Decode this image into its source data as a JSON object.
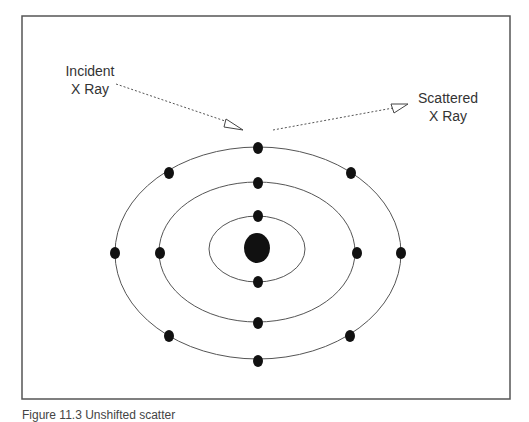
{
  "diagram": {
    "labels": {
      "incident": [
        "Incident",
        "X Ray"
      ],
      "scattered": [
        "Scattered",
        "X Ray"
      ]
    },
    "caption": "Figure 11.3 Unshifted scatter",
    "nucleus": {
      "cx": 257,
      "cy": 249,
      "rx": 13,
      "ry": 15
    },
    "orbits": [
      {
        "name": "inner",
        "rx": 48,
        "ry": 33,
        "electrons": 2
      },
      {
        "name": "middle",
        "rx": 98,
        "ry": 70,
        "electrons": 4
      },
      {
        "name": "outer",
        "rx": 143,
        "ry": 104,
        "electrons": 6
      }
    ],
    "colors": {
      "stroke": "#555555",
      "fill": "#111111",
      "frame": "#555555"
    }
  }
}
